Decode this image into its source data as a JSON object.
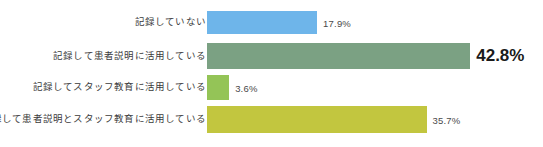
{
  "chart_data": {
    "type": "bar",
    "orientation": "horizontal",
    "title": "",
    "subtitle": "",
    "xlabel": "",
    "ylabel": "",
    "grid": false,
    "legend": false,
    "axis_visible": false,
    "value_suffix": "%",
    "xlim": [
      0,
      100
    ],
    "categories": [
      "記録していない",
      "記録して患者説明に活用している",
      "記録してスタッフ教育に活用している",
      "記録して患者説明とスタッフ教育に活用している"
    ],
    "values": [
      17.9,
      42.8,
      3.6,
      35.7
    ],
    "value_labels": [
      "17.9%",
      "42.8%",
      "3.6%",
      "35.7%"
    ],
    "bar_colors": [
      "#6EB5EA",
      "#7BA183",
      "#94C457",
      "#C2C63F"
    ],
    "emphasized_index": 1
  },
  "bars": [
    {
      "label": "記録していない",
      "value": 17.9,
      "value_label": "17.9%",
      "color": "#6EB5EA",
      "emphasis": false
    },
    {
      "label": "記録して患者説明に活用している",
      "value": 42.8,
      "value_label": "42.8%",
      "color": "#7BA183",
      "emphasis": true
    },
    {
      "label": "記録してスタッフ教育に活用している",
      "value": 3.6,
      "value_label": "3.6%",
      "color": "#94C457",
      "emphasis": false
    },
    {
      "label": "記録して患者説明とスタッフ教育に活用している",
      "value": 35.7,
      "value_label": "35.7%",
      "color": "#C2C63F",
      "emphasis": false
    }
  ],
  "scale": {
    "px_per_percent": 6.15,
    "bar_origin_x": 207
  }
}
